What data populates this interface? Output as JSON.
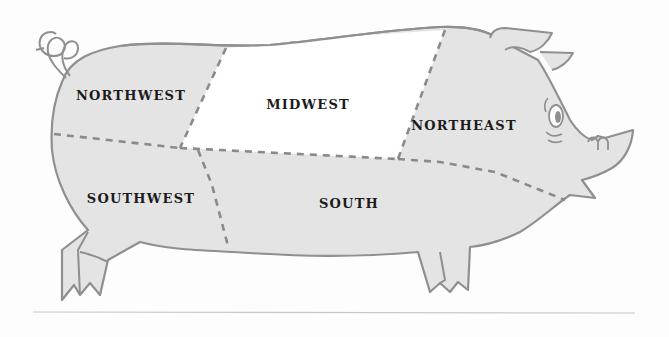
{
  "diagram": {
    "colors": {
      "body_fill": "#e4e4e4",
      "highlight_fill": "#ffffff",
      "outline": "#8f8f8f",
      "divider": "#8a8a8a",
      "label": "#1b1b1b",
      "rule": "#c8c8c8"
    },
    "regions": [
      {
        "id": "northwest",
        "label": "NORTHWEST",
        "highlighted": false
      },
      {
        "id": "midwest",
        "label": "MIDWEST",
        "highlighted": true
      },
      {
        "id": "northeast",
        "label": "NORTHEAST",
        "highlighted": false
      },
      {
        "id": "southwest",
        "label": "SOUTHWEST",
        "highlighted": false
      },
      {
        "id": "south",
        "label": "SOUTH",
        "highlighted": false
      }
    ]
  }
}
